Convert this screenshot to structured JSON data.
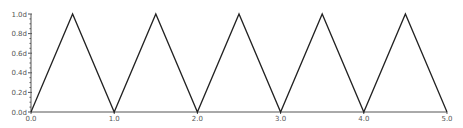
{
  "chart_data": {
    "type": "line",
    "title": "",
    "xlabel": "",
    "ylabel": "",
    "xlim": [
      0.0,
      5.0
    ],
    "ylim": [
      0.0,
      1.0
    ],
    "grid": false,
    "legend": null,
    "x_ticks": [
      "0.0",
      "1.0",
      "2.0",
      "3.0",
      "4.0",
      "5.0"
    ],
    "y_ticks": [
      "0.0d",
      "0.2d",
      "0.4d",
      "0.6d",
      "0.8d",
      "1.0d"
    ],
    "series": [
      {
        "name": "triangle wave",
        "color": "#222222",
        "x": [
          0.0,
          0.5,
          1.0,
          1.5,
          2.0,
          2.5,
          3.0,
          3.5,
          4.0,
          4.5,
          5.0
        ],
        "y": [
          0.0,
          1.0,
          0.0,
          1.0,
          0.0,
          1.0,
          0.0,
          1.0,
          0.0,
          1.0,
          0.0
        ]
      }
    ]
  },
  "layout": {
    "plot_left": 31,
    "plot_right": 447,
    "plot_top": 14,
    "plot_bottom": 112
  }
}
